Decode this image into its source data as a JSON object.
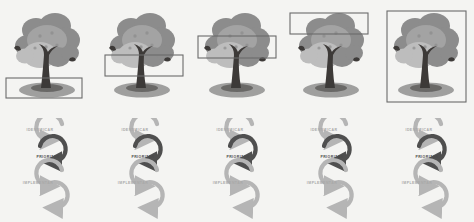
{
  "figure": {
    "background_color": "#f4f4f2",
    "panel_count": 5,
    "description_alt": "Secuencia de cinco arboles con rectangulo de seleccion ascendente y ciclo IDENTIFICAR-PRIORIZAR-IMPLEMENTAR"
  },
  "cycle": {
    "stages": [
      {
        "label": "IDENTIFICAR",
        "tone": "light",
        "color": "#a8a8a8"
      },
      {
        "label": "PRIORIZAR",
        "tone": "dark",
        "color": "#4a4a4a"
      },
      {
        "label": "IMPLEMENTAR",
        "tone": "light",
        "color": "#a8a8a8"
      }
    ]
  },
  "colors": {
    "canopy_dark": "#8c8c8c",
    "canopy_mid": "#a3a3a3",
    "canopy_light": "#bdbdbd",
    "trunk": "#3d3a38",
    "ground_shadow": "#8f8f8f",
    "selection_stroke": "#6b6b6b",
    "arrow_light": "#b5b5b5",
    "arrow_dark": "#4f4f4f",
    "background": "#f4f4f2"
  },
  "panels": [
    {
      "index": 1,
      "name": "panel-roots",
      "selection": {
        "x": 6,
        "y": 78,
        "width": 76,
        "height": 20,
        "region": "raices-suelo"
      }
    },
    {
      "index": 2,
      "name": "panel-lower-canopy",
      "selection": {
        "x": 10,
        "y": 55,
        "width": 78,
        "height": 21,
        "region": "copa-baja"
      }
    },
    {
      "index": 3,
      "name": "panel-mid-canopy",
      "selection": {
        "x": 8,
        "y": 36,
        "width": 78,
        "height": 22,
        "region": "copa-media"
      }
    },
    {
      "index": 4,
      "name": "panel-upper-canopy",
      "selection": {
        "x": 6,
        "y": 13,
        "width": 78,
        "height": 21,
        "region": "copa-alta"
      }
    },
    {
      "index": 5,
      "name": "panel-whole-tree",
      "selection": {
        "x": 8,
        "y": 11,
        "width": 79,
        "height": 91,
        "region": "arbol-completo"
      }
    }
  ]
}
